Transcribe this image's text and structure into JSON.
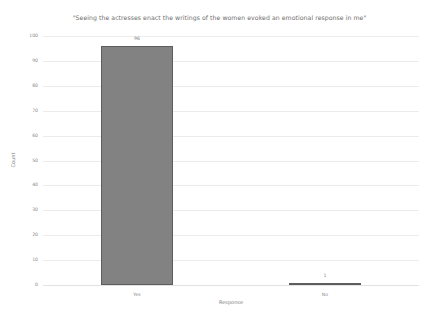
{
  "chart_data": {
    "type": "bar",
    "title": "\"Seeing the actresses enact the writings of the women evoked an emotional response in me\"",
    "xlabel": "Response",
    "ylabel": "Count",
    "categories": [
      "Yes",
      "No"
    ],
    "values": [
      96,
      1
    ],
    "data_labels": [
      "96",
      "1"
    ],
    "yticks": [
      0,
      10,
      20,
      30,
      40,
      50,
      60,
      70,
      80,
      90,
      100
    ],
    "ytick_labels": [
      "0",
      "10",
      "20",
      "30",
      "40",
      "50",
      "60",
      "70",
      "80",
      "90",
      "100"
    ],
    "ylim": [
      0,
      100
    ],
    "grid": true,
    "legend": false,
    "legend_position": "none",
    "bar_color": "#828282",
    "bar_edge_color": "#5d5d5d",
    "grid_color": "#ececec",
    "text_color": "#8a8a8a",
    "background_color": "#ffffff"
  }
}
